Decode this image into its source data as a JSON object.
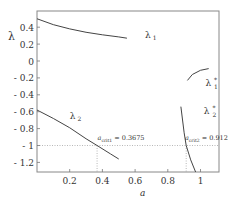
{
  "chart_data": {
    "type": "line",
    "title": "",
    "xlabel": "a",
    "ylabel": "λ",
    "xlim": [
      0,
      1.12
    ],
    "ylim": [
      -1.32,
      0.6
    ],
    "grid": false,
    "legend": "none (inline curve labels)",
    "x_ticks": [
      {
        "value": 0.2,
        "label": "0.2"
      },
      {
        "value": 0.4,
        "label": "0.4"
      },
      {
        "value": 0.6,
        "label": "0.6"
      },
      {
        "value": 0.8,
        "label": "0.8"
      },
      {
        "value": 1.0,
        "label": "1"
      }
    ],
    "y_ticks": [
      {
        "value": 0.4,
        "label": "0.4"
      },
      {
        "value": 0.2,
        "label": "0.2"
      },
      {
        "value": 0,
        "label": "0"
      },
      {
        "value": -0.2,
        "label": "- 0.2"
      },
      {
        "value": -0.4,
        "label": "- 0.4"
      },
      {
        "value": -0.6,
        "label": "- 0.6"
      },
      {
        "value": -0.8,
        "label": "- 0.8"
      },
      {
        "value": -1,
        "label": "- 1"
      },
      {
        "value": -1.2,
        "label": "- 1.2"
      }
    ],
    "series": [
      {
        "name": "λ1",
        "label_main": "λ",
        "label_sub": "1",
        "label_sup": "",
        "label_at": [
          0.66,
          0.27
        ],
        "x": [
          0.0,
          0.1,
          0.2,
          0.3,
          0.4,
          0.5,
          0.55
        ],
        "y": [
          0.5,
          0.43,
          0.38,
          0.34,
          0.31,
          0.285,
          0.27
        ]
      },
      {
        "name": "λ2",
        "label_main": "λ",
        "label_sub": "2",
        "label_sup": "",
        "label_at": [
          0.2,
          -0.69
        ],
        "x": [
          0.0,
          0.1,
          0.2,
          0.3,
          0.3675,
          0.45,
          0.5
        ],
        "y": [
          -0.58,
          -0.68,
          -0.79,
          -0.92,
          -1.0,
          -1.1,
          -1.16
        ]
      },
      {
        "name": "λ1*",
        "label_main": "λ",
        "label_sub": "1",
        "label_sup": "*",
        "label_at": [
          1.03,
          -0.3
        ],
        "x": [
          0.92,
          0.95,
          1.0,
          1.05
        ],
        "y": [
          -0.23,
          -0.16,
          -0.11,
          -0.09
        ]
      },
      {
        "name": "λ2*",
        "label_main": "λ",
        "label_sub": "2",
        "label_sup": "*",
        "label_at": [
          1.02,
          -0.63
        ],
        "x": [
          0.88,
          0.9,
          0.9125,
          0.94,
          0.97
        ],
        "y": [
          -0.54,
          -0.85,
          -1.0,
          -1.17,
          -1.32
        ]
      }
    ],
    "reference_lines": [
      {
        "type": "horizontal",
        "y": -1,
        "style": "dotted"
      },
      {
        "type": "vertical",
        "x": 0.3675,
        "style": "dotted"
      },
      {
        "type": "vertical",
        "x": 0.9125,
        "style": "dotted"
      }
    ],
    "annotations": [
      {
        "text_main": "a",
        "text_sub": "crit1",
        "text_rest": " = 0.3675",
        "at": [
          0.37,
          -0.94
        ]
      },
      {
        "text_main": "a",
        "text_sub": "crit2",
        "text_rest": " = 0.9125",
        "at": [
          0.905,
          -0.94
        ]
      }
    ]
  }
}
